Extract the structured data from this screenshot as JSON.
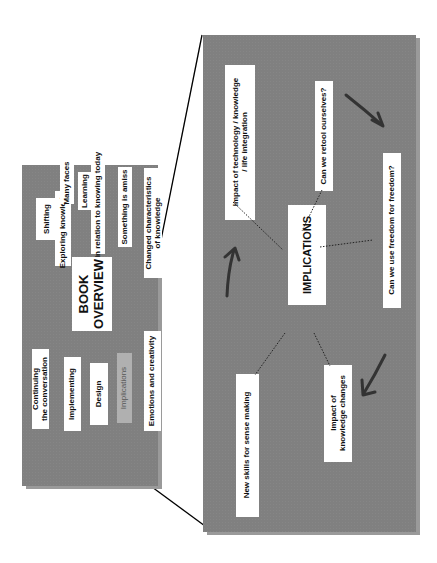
{
  "overview": {
    "title_line1": "BOOK",
    "title_line2": "OVERVIEW",
    "items": [
      {
        "label": "Shifting"
      },
      {
        "label": "Exploring knowledge"
      },
      {
        "label": "Many faces"
      },
      {
        "label": "Learning"
      },
      {
        "label": "In relation to knowing today"
      },
      {
        "label": "Something is amiss"
      },
      {
        "label": "Changed characteristics"
      },
      {
        "label": "of knowledge"
      },
      {
        "label": "Continuing"
      },
      {
        "label": "the conversation"
      },
      {
        "label": "Implementing"
      },
      {
        "label": "Design"
      },
      {
        "label": "Implications"
      },
      {
        "label": "Emotions and creativity"
      }
    ]
  },
  "implications": {
    "title": "IMPLICATIONS",
    "items": [
      {
        "line1": "Impact of technology / knowledge",
        "line2": "/ life integration"
      },
      {
        "line1": "Can we retool ourselves?"
      },
      {
        "line1": "Can we use freedom for freedom?"
      },
      {
        "line1": "Impact of",
        "line2": "knowledge changes"
      },
      {
        "line1": "New skills for sense making"
      }
    ]
  },
  "colors": {
    "panel": "#808080",
    "box": "#ffffff",
    "highlight_box": "#b0b0b0",
    "arrow": "#333333"
  }
}
